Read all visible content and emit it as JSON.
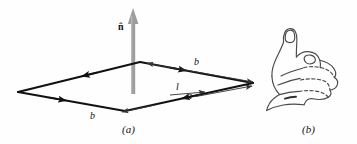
{
  "figure": {
    "panels": [
      {
        "id": "a",
        "caption": "(a)",
        "description": "Rectangular current loop in perspective with outward normal vector"
      },
      {
        "id": "b",
        "caption": "(b)",
        "description": "Right hand with thumb extended showing right-hand rule"
      }
    ],
    "labels": {
      "normal_vector": "n̂",
      "side_b_top": "b",
      "side_a": "a",
      "current": "l",
      "side_b_bottom": "b"
    },
    "colors": {
      "background": "#fefefe",
      "ink": "#111111",
      "normal_arrow": "#9a9a9a",
      "hand_outline": "#4a4a4a"
    },
    "geometry": {
      "loop_vertices": [
        {
          "name": "left",
          "x": 18,
          "y": 92
        },
        {
          "name": "top",
          "x": 140,
          "y": 62
        },
        {
          "name": "right",
          "x": 253,
          "y": 83
        },
        {
          "name": "bottom",
          "x": 125,
          "y": 111
        }
      ],
      "normal_arrow": {
        "x": 133,
        "y_tip": 8,
        "y_base": 92
      },
      "current_direction": "counterclockwise viewed from above"
    }
  }
}
